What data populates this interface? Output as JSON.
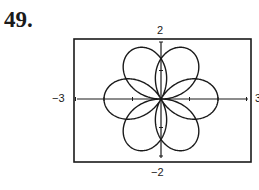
{
  "exercise": {
    "number": "49."
  },
  "chart_data": {
    "type": "line",
    "title": "",
    "xlabel": "",
    "ylabel": "",
    "xlim": [
      -3,
      3
    ],
    "ylim": [
      -2,
      2
    ],
    "window_labels": {
      "ymax": "2",
      "ymin": "−2",
      "xmin": "−3",
      "xmax": "3"
    },
    "grid": false,
    "legend": null,
    "series": [
      {
        "name": "r = 2 sin(3θ/2)",
        "equation": "r = 2 sin(3θ/2)",
        "theta_range": [
          0,
          12.566
        ],
        "color": "#1a1a1a"
      }
    ]
  }
}
